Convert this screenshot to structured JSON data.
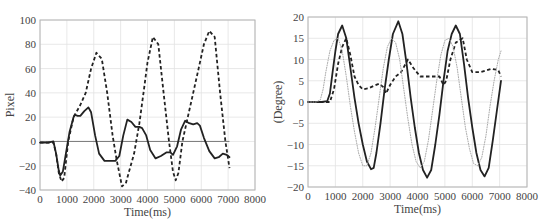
{
  "chart_data": [
    {
      "type": "line",
      "title": "",
      "xlabel": "Time(ms)",
      "ylabel": "Pixel",
      "xlim": [
        0,
        8000
      ],
      "ylim": [
        -40,
        100
      ],
      "xticks": [
        0,
        1000,
        2000,
        3000,
        4000,
        5000,
        6000,
        7000,
        8000
      ],
      "yticks": [
        -40,
        -20,
        0,
        20,
        40,
        60,
        80,
        100
      ],
      "grid": true,
      "legend": null,
      "reference_line": 0,
      "series": [
        {
          "name": "solid",
          "style": "solid",
          "color": "#222222",
          "x": [
            0,
            300,
            500,
            600,
            700,
            750,
            850,
            950,
            1100,
            1250,
            1300,
            1400,
            1500,
            1650,
            1800,
            1900,
            2050,
            2200,
            2400,
            2600,
            2800,
            2950,
            3100,
            3250,
            3400,
            3550,
            3700,
            3800,
            3950,
            4100,
            4300,
            4500,
            4700,
            4850,
            4950,
            5100,
            5250,
            5400,
            5550,
            5700,
            5850,
            5950,
            6100,
            6300,
            6500,
            6650,
            6800,
            6950,
            7050
          ],
          "y": [
            -1,
            -1,
            0,
            -10,
            -24,
            -28,
            -25,
            -12,
            8,
            20,
            22,
            21,
            21,
            25,
            28,
            24,
            5,
            -10,
            -16,
            -16,
            -16,
            -12,
            5,
            18,
            16,
            12,
            12,
            11,
            5,
            -7,
            -14,
            -12,
            -9,
            -9,
            -11,
            -4,
            10,
            17,
            15,
            14,
            15,
            13,
            3,
            -8,
            -14,
            -13,
            -10,
            -11,
            -13
          ]
        },
        {
          "name": "dashed",
          "style": "dashed",
          "color": "#222222",
          "x": [
            0,
            300,
            500,
            600,
            700,
            800,
            900,
            1050,
            1250,
            1500,
            1700,
            1900,
            2100,
            2300,
            2500,
            2700,
            2850,
            3050,
            3200,
            3350,
            3500,
            3700,
            3850,
            4000,
            4200,
            4400,
            4600,
            4800,
            4950,
            5050,
            5150,
            5300,
            5500,
            5700,
            5900,
            6100,
            6300,
            6500,
            6700,
            6900,
            7050
          ],
          "y": [
            -1,
            -1,
            -1,
            -10,
            -26,
            -33,
            -30,
            0,
            20,
            30,
            40,
            60,
            73,
            68,
            40,
            5,
            -15,
            -37,
            -34,
            -22,
            -10,
            15,
            40,
            65,
            86,
            80,
            40,
            0,
            -25,
            -32,
            -26,
            0,
            20,
            40,
            60,
            80,
            91,
            86,
            40,
            0,
            -22
          ]
        }
      ]
    },
    {
      "type": "line",
      "title": "",
      "xlabel": "Time(ms)",
      "ylabel": "(Degree)",
      "xlim": [
        0,
        8000
      ],
      "ylim": [
        -20,
        20
      ],
      "xticks": [
        0,
        1000,
        2000,
        3000,
        4000,
        5000,
        6000,
        7000,
        8000
      ],
      "yticks": [
        -20,
        -15,
        -10,
        -5,
        0,
        5,
        10,
        15,
        20
      ],
      "grid": true,
      "legend": null,
      "series": [
        {
          "name": "solid",
          "style": "solid",
          "color": "#222222",
          "x": [
            0,
            300,
            500,
            700,
            800,
            900,
            1000,
            1100,
            1250,
            1400,
            1550,
            1700,
            1850,
            2000,
            2150,
            2300,
            2400,
            2500,
            2650,
            2800,
            2950,
            3100,
            3300,
            3450,
            3600,
            3750,
            3900,
            4050,
            4200,
            4350,
            4500,
            4650,
            4800,
            4950,
            5100,
            5250,
            5400,
            5550,
            5700,
            5850,
            6000,
            6150,
            6300,
            6450,
            6600,
            6750,
            6900,
            7050
          ],
          "y": [
            0,
            0,
            0,
            0.2,
            2,
            7,
            12,
            16,
            18,
            15,
            8,
            1,
            -5,
            -10,
            -14,
            -15.8,
            -15.5,
            -12,
            -5,
            3,
            10,
            16,
            19,
            16,
            9,
            1,
            -6,
            -12,
            -16,
            -17.8,
            -16,
            -10,
            -3,
            5,
            12,
            16,
            18,
            16,
            9,
            1,
            -6,
            -12,
            -16,
            -17.5,
            -15.5,
            -9,
            -2,
            5
          ]
        },
        {
          "name": "dashed",
          "style": "dashed",
          "color": "#222222",
          "x": [
            0,
            300,
            600,
            800,
            950,
            1100,
            1250,
            1400,
            1550,
            1700,
            1850,
            2000,
            2200,
            2400,
            2600,
            2750,
            2850,
            3000,
            3200,
            3400,
            3650,
            3850,
            4100,
            4400,
            4800,
            4950,
            5050,
            5200,
            5400,
            5650,
            5800,
            6000,
            6300,
            6700,
            6950,
            7050
          ],
          "y": [
            0,
            0,
            0,
            0,
            3,
            9,
            13,
            15,
            11,
            6,
            4,
            3,
            3.2,
            3.8,
            4.3,
            3.5,
            2,
            4,
            6,
            7,
            10,
            8,
            6,
            6,
            6,
            4,
            5,
            10,
            14,
            15,
            10,
            7,
            7,
            7.8,
            7.5,
            6
          ]
        },
        {
          "name": "dotted",
          "style": "dotted",
          "color": "#aaaaaa",
          "x": [
            0,
            300,
            450,
            550,
            650,
            800,
            950,
            1100,
            1250,
            1400,
            1550,
            1700,
            1850,
            2000,
            2150,
            2300,
            2450,
            2600,
            2750,
            2900,
            3050,
            3200,
            3350,
            3500,
            3650,
            3800,
            3950,
            4100,
            4250,
            4400,
            4550,
            4700,
            4850,
            5000,
            5150,
            5300,
            5450,
            5600,
            5750,
            5900,
            6050,
            6200,
            6350,
            6500,
            6650,
            6800,
            6950,
            7050
          ],
          "y": [
            0,
            0,
            0.5,
            3,
            7,
            12,
            14.5,
            15,
            12,
            6,
            -1,
            -7,
            -12,
            -15,
            -15,
            -12,
            -6,
            1,
            8,
            13,
            15,
            14,
            10,
            3,
            -4,
            -10,
            -14,
            -15.5,
            -14,
            -9,
            -2,
            5,
            11,
            14.5,
            15,
            13,
            8,
            1,
            -6,
            -11,
            -14.5,
            -15,
            -13,
            -8,
            -1,
            5,
            10,
            12
          ]
        }
      ]
    }
  ]
}
